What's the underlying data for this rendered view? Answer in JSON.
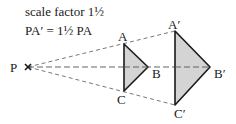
{
  "caption": {
    "line1": "scale factor 1½",
    "line2": "PA′ = 1½ PA"
  },
  "labels": {
    "P": "P",
    "A": "A",
    "B": "B",
    "C": "C",
    "A_prime": "A′",
    "B_prime": "B′",
    "C_prime": "C′"
  },
  "points": {
    "P": [
      28,
      67
    ],
    "A": [
      124,
      44
    ],
    "B": [
      148,
      67
    ],
    "C": [
      124,
      91
    ],
    "A_prime": [
      175,
      31
    ],
    "B_prime": [
      210,
      67
    ],
    "C_prime": [
      175,
      105
    ]
  },
  "colors": {
    "fill": "#d4d4d4",
    "stroke": "#1a1a1a",
    "dashed": "#555555"
  }
}
